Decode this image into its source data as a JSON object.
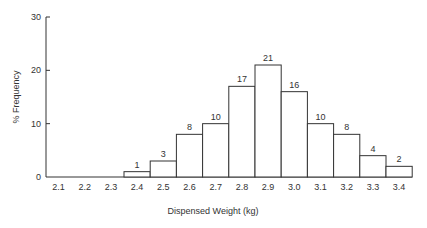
{
  "chart_data": {
    "type": "bar",
    "title": "",
    "xlabel": "Dispensed Weight (kg)",
    "ylabel": "% Frequency",
    "ylim": [
      0,
      30
    ],
    "yticks": [
      0,
      10,
      20,
      30
    ],
    "grid": false,
    "categories": [
      "2.1",
      "2.2",
      "2.3",
      "2.4",
      "2.5",
      "2.6",
      "2.7",
      "2.8",
      "2.9",
      "3.0",
      "3.1",
      "3.2",
      "3.3",
      "3.4"
    ],
    "values": [
      0,
      0,
      0,
      1,
      3,
      8,
      10,
      17,
      21,
      16,
      10,
      8,
      4,
      2
    ],
    "data_labels": [
      "",
      "",
      "",
      "1",
      "3",
      "8",
      "10",
      "17",
      "21",
      "16",
      "10",
      "8",
      "4",
      "2"
    ]
  },
  "colors": {
    "bar_fill": "#ffffff",
    "bar_stroke": "#333333",
    "axis": "#333333"
  }
}
